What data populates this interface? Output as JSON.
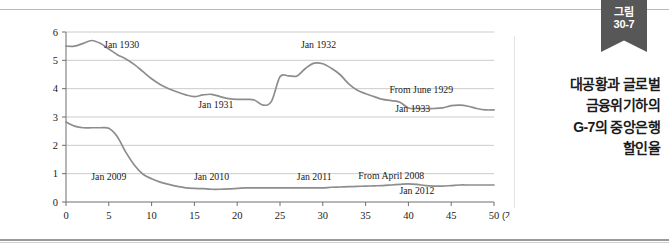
{
  "figure": {
    "badge_line1": "그림",
    "badge_line2": "30-7",
    "caption_lines": [
      "대공황과 글로벌",
      "금융위기하의",
      "G-7의 중앙은행",
      "할인율"
    ],
    "accent_color": "#575757",
    "line_color": "#8d8d8d",
    "grid_color": "#c5c5c5"
  },
  "chart_data": {
    "type": "line",
    "title": "대공황과 글로벌 금융위기하의 G-7의 중앙은행 할인율",
    "xlabel": "(개월수)",
    "ylabel": "",
    "xlim": [
      0,
      50
    ],
    "ylim": [
      0,
      6
    ],
    "grid": true,
    "legend": "none",
    "x_ticks": [
      "0",
      "5",
      "10",
      "15",
      "20",
      "25",
      "30",
      "35",
      "40",
      "45",
      "50"
    ],
    "y_ticks": [
      "0",
      "1",
      "2",
      "3",
      "4",
      "5",
      "6"
    ],
    "x_unit_label": "(개월수)",
    "series": [
      {
        "name": "From June 1929",
        "x": [
          0,
          1,
          2,
          3,
          4,
          5,
          6,
          7,
          8,
          9,
          10,
          11,
          12,
          13,
          14,
          15,
          16,
          17,
          18,
          19,
          20,
          21,
          22,
          23,
          24,
          25,
          26,
          27,
          28,
          29,
          30,
          31,
          32,
          33,
          34,
          35,
          36,
          37,
          38,
          39,
          40,
          41,
          42,
          43,
          44,
          45,
          46,
          47,
          48,
          49,
          50
        ],
        "values": [
          5.5,
          5.5,
          5.6,
          5.7,
          5.6,
          5.4,
          5.2,
          5.05,
          4.85,
          4.6,
          4.35,
          4.15,
          4.0,
          3.88,
          3.78,
          3.72,
          3.78,
          3.8,
          3.72,
          3.65,
          3.62,
          3.62,
          3.6,
          3.42,
          3.55,
          4.42,
          4.45,
          4.45,
          4.72,
          4.9,
          4.88,
          4.72,
          4.5,
          4.18,
          3.95,
          3.82,
          3.72,
          3.62,
          3.58,
          3.52,
          3.32,
          3.3,
          3.3,
          3.3,
          3.32,
          3.4,
          3.42,
          3.38,
          3.3,
          3.25,
          3.25
        ]
      },
      {
        "name": "From April 2008",
        "x": [
          0,
          1,
          2,
          3,
          4,
          5,
          6,
          7,
          8,
          9,
          10,
          11,
          12,
          13,
          14,
          15,
          16,
          17,
          18,
          19,
          20,
          21,
          22,
          23,
          24,
          25,
          26,
          27,
          28,
          29,
          30,
          31,
          32,
          33,
          34,
          35,
          36,
          37,
          38,
          39,
          40,
          41,
          42,
          43,
          44,
          45,
          46,
          47,
          48,
          49,
          50
        ],
        "values": [
          2.82,
          2.68,
          2.62,
          2.62,
          2.62,
          2.6,
          2.3,
          1.75,
          1.3,
          0.98,
          0.82,
          0.7,
          0.62,
          0.55,
          0.5,
          0.48,
          0.47,
          0.45,
          0.45,
          0.46,
          0.48,
          0.5,
          0.5,
          0.5,
          0.5,
          0.5,
          0.5,
          0.5,
          0.5,
          0.5,
          0.5,
          0.52,
          0.53,
          0.54,
          0.55,
          0.56,
          0.57,
          0.58,
          0.6,
          0.62,
          0.64,
          0.62,
          0.58,
          0.56,
          0.56,
          0.58,
          0.6,
          0.6,
          0.6,
          0.6,
          0.6
        ]
      }
    ],
    "annotations": [
      {
        "text": "Jan 1930",
        "x": 6.5,
        "y": 5.45
      },
      {
        "text": "Jan 1931",
        "x": 17.5,
        "y": 3.32
      },
      {
        "text": "Jan 1932",
        "x": 29.5,
        "y": 5.45
      },
      {
        "text": "From June 1929",
        "x": 41.5,
        "y": 3.85
      },
      {
        "text": "Jan 1933",
        "x": 40.5,
        "y": 3.18
      },
      {
        "text": "Jan 2009",
        "x": 5.0,
        "y": 0.78
      },
      {
        "text": "Jan 2010",
        "x": 17.0,
        "y": 0.78
      },
      {
        "text": "Jan 2011",
        "x": 29.0,
        "y": 0.78
      },
      {
        "text": "From April 2008",
        "x": 38.0,
        "y": 0.8
      },
      {
        "text": "Jan 2012",
        "x": 41.0,
        "y": 0.3
      }
    ]
  }
}
